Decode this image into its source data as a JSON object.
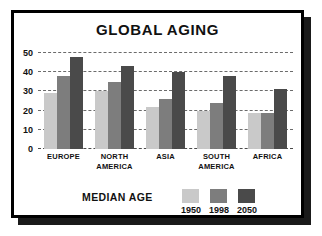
{
  "frame": {
    "border_color": "#000000",
    "background": "#ffffff"
  },
  "chart_data": {
    "type": "bar",
    "title": "GLOBAL AGING",
    "xlabel": "",
    "ylabel": "",
    "ylim": [
      0,
      50
    ],
    "yticks": [
      0,
      10,
      20,
      30,
      40,
      50
    ],
    "ytick_labels": [
      "0",
      "10",
      "20",
      "30",
      "40",
      "50"
    ],
    "grid": true,
    "grid_style": "dashed-horizontal",
    "legend_title": "MEDIAN AGE",
    "legend_position": "bottom",
    "categories": [
      "EUROPE",
      "NORTH AMERICA",
      "ASIA",
      "SOUTH AMERICA",
      "AFRICA"
    ],
    "series": [
      {
        "name": "1950",
        "color": "#c9c9c9",
        "values": [
          29,
          30,
          22,
          20,
          19
        ]
      },
      {
        "name": "1998",
        "color": "#7d7d7d",
        "values": [
          38,
          35,
          26,
          24,
          19
        ]
      },
      {
        "name": "2050",
        "color": "#4a4a4a",
        "values": [
          48,
          43,
          40,
          38,
          31
        ]
      }
    ]
  }
}
